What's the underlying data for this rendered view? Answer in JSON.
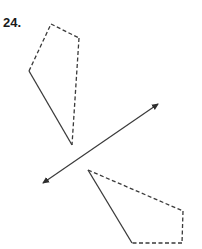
{
  "problem": {
    "number_label": "24."
  },
  "diagram": {
    "type": "reflection",
    "stroke_color": "#3a3a3a",
    "mirror_line": {
      "start": [
        43,
        183
      ],
      "end": [
        158,
        104
      ],
      "arrows": "both"
    },
    "original_shape": {
      "vertices": [
        [
          51,
          24
        ],
        [
          79,
          38
        ],
        [
          72,
          145
        ],
        [
          29,
          71
        ]
      ],
      "edges": [
        {
          "from": 0,
          "to": 1,
          "style": "dashed"
        },
        {
          "from": 1,
          "to": 2,
          "style": "dashed"
        },
        {
          "from": 2,
          "to": 3,
          "style": "solid"
        },
        {
          "from": 3,
          "to": 0,
          "style": "dashed"
        }
      ]
    },
    "image_shape": {
      "vertices": [
        [
          88,
          170
        ],
        [
          183,
          211
        ],
        [
          182,
          243
        ],
        [
          132,
          243
        ]
      ],
      "edges": [
        {
          "from": 0,
          "to": 1,
          "style": "dashed"
        },
        {
          "from": 1,
          "to": 2,
          "style": "dashed"
        },
        {
          "from": 2,
          "to": 3,
          "style": "dashed"
        },
        {
          "from": 3,
          "to": 0,
          "style": "solid"
        }
      ]
    }
  }
}
